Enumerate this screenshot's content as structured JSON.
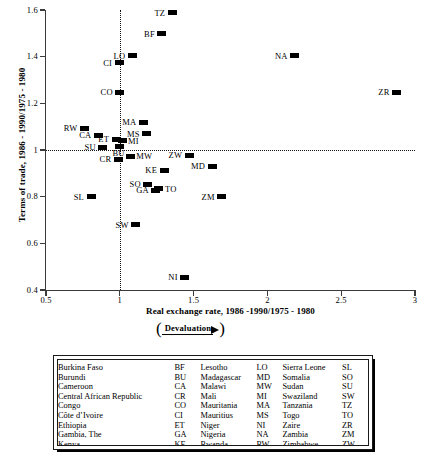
{
  "chart_data": {
    "type": "scatter",
    "title": "",
    "xlabel": "Real exchange rate, 1986 -1990/1975 - 1980",
    "ylabel": "Terms of trade, 1986 - 1990/1975 - 1980",
    "xlim": [
      0.5,
      3
    ],
    "ylim": [
      0.4,
      1.6
    ],
    "xticks": [
      "0.5",
      "1",
      "1.5",
      "2",
      "2.5",
      "3"
    ],
    "xtick_values": [
      0.5,
      1,
      1.5,
      2,
      2.5,
      3
    ],
    "yticks": [
      "0.4",
      "0.6",
      "0.8",
      "1",
      "1.2",
      "1.4",
      "1.6"
    ],
    "ytick_values": [
      0.4,
      0.6,
      0.8,
      1.0,
      1.2,
      1.4,
      1.6
    ],
    "grid": false,
    "reference_lines": {
      "horizontal": 1.0,
      "vertical": 1.0,
      "style": "dotted"
    },
    "legend_position": "below-plot",
    "annotation": {
      "text": "Devaluation",
      "open_paren": "(",
      "close_paren": ")",
      "arrow": "right-arrow"
    },
    "points": [
      {
        "label": "TZ",
        "x": 1.355,
        "y": 1.588,
        "label_pos": "left"
      },
      {
        "label": "BF",
        "x": 1.285,
        "y": 1.498,
        "label_pos": "left"
      },
      {
        "label": "NA",
        "x": 2.185,
        "y": 1.405,
        "label_pos": "left"
      },
      {
        "label": "LO",
        "x": 1.085,
        "y": 1.405,
        "label_pos": "left"
      },
      {
        "label": "CI",
        "x": 0.995,
        "y": 1.375,
        "label_pos": "left"
      },
      {
        "label": "ZR",
        "x": 2.875,
        "y": 1.248,
        "label_pos": "left"
      },
      {
        "label": "CO",
        "x": 1.0,
        "y": 1.248,
        "label_pos": "left"
      },
      {
        "label": "MA",
        "x": 1.16,
        "y": 1.118,
        "label_pos": "left"
      },
      {
        "label": "RW",
        "x": 0.76,
        "y": 1.093,
        "label_pos": "left"
      },
      {
        "label": "MS",
        "x": 1.183,
        "y": 1.07,
        "label_pos": "left"
      },
      {
        "label": "CA",
        "x": 0.855,
        "y": 1.063,
        "label_pos": "left"
      },
      {
        "label": "ET",
        "x": 0.975,
        "y": 1.047,
        "label_pos": "left"
      },
      {
        "label": "MI",
        "x": 1.015,
        "y": 1.04,
        "label_pos": "right"
      },
      {
        "label": "SU",
        "x": 0.885,
        "y": 1.012,
        "label_pos": "left"
      },
      {
        "label": "BU",
        "x": 0.995,
        "y": 1.013,
        "label_pos": "below"
      },
      {
        "label": "ZW",
        "x": 1.47,
        "y": 0.978,
        "label_pos": "left"
      },
      {
        "label": "MW",
        "x": 1.07,
        "y": 0.973,
        "label_pos": "right"
      },
      {
        "label": "CR",
        "x": 0.99,
        "y": 0.96,
        "label_pos": "left"
      },
      {
        "label": "MD",
        "x": 1.625,
        "y": 0.93,
        "label_pos": "left"
      },
      {
        "label": "KE",
        "x": 1.3,
        "y": 0.913,
        "label_pos": "left"
      },
      {
        "label": "SO",
        "x": 1.19,
        "y": 0.853,
        "label_pos": "left"
      },
      {
        "label": "GA",
        "x": 1.245,
        "y": 0.828,
        "label_pos": "left"
      },
      {
        "label": "TO",
        "x": 1.265,
        "y": 0.833,
        "label_pos": "right"
      },
      {
        "label": "ZM",
        "x": 1.69,
        "y": 0.8,
        "label_pos": "left"
      },
      {
        "label": "SL",
        "x": 0.805,
        "y": 0.8,
        "label_pos": "left"
      },
      {
        "label": "SW",
        "x": 1.108,
        "y": 0.68,
        "label_pos": "left"
      },
      {
        "label": "NI",
        "x": 1.44,
        "y": 0.455,
        "label_pos": "left"
      }
    ]
  },
  "legend": {
    "columns": [
      [
        {
          "country": "Burkina Faso",
          "code": "BF"
        },
        {
          "country": "Burundi",
          "code": "BU"
        },
        {
          "country": "Cameroon",
          "code": "CA"
        },
        {
          "country": "Central African Republic",
          "code": "CR"
        },
        {
          "country": "Congo",
          "code": "CO"
        },
        {
          "country": "Côte d’Ivoire",
          "code": "CI"
        },
        {
          "country": "Ethiopia",
          "code": "ET"
        },
        {
          "country": "Gambia, The",
          "code": "GA"
        },
        {
          "country": "Kenya",
          "code": "KE"
        }
      ],
      [
        {
          "country": "Lesotho",
          "code": "LO"
        },
        {
          "country": "Madagascar",
          "code": "MD"
        },
        {
          "country": "Malawi",
          "code": "MW"
        },
        {
          "country": "Mali",
          "code": "MI"
        },
        {
          "country": "Mauritania",
          "code": "MA"
        },
        {
          "country": "Mauritius",
          "code": "MS"
        },
        {
          "country": "Niger",
          "code": "NI"
        },
        {
          "country": "Nigeria",
          "code": "NA"
        },
        {
          "country": "Rwanda",
          "code": "RW"
        }
      ],
      [
        {
          "country": "Sierra Leone",
          "code": "SL"
        },
        {
          "country": "Somalia",
          "code": "SO"
        },
        {
          "country": "Sudan",
          "code": "SU"
        },
        {
          "country": "Swaziland",
          "code": "SW"
        },
        {
          "country": "Tanzania",
          "code": "TZ"
        },
        {
          "country": "Togo",
          "code": "TO"
        },
        {
          "country": "Zaire",
          "code": "ZR"
        },
        {
          "country": "Zambia",
          "code": "ZM"
        },
        {
          "country": "Zimbabwe",
          "code": "ZW"
        }
      ]
    ]
  },
  "colors": {
    "marker": "#000000",
    "axis": "#3b3b3b",
    "text": "#000000",
    "background": "#ffffff"
  }
}
